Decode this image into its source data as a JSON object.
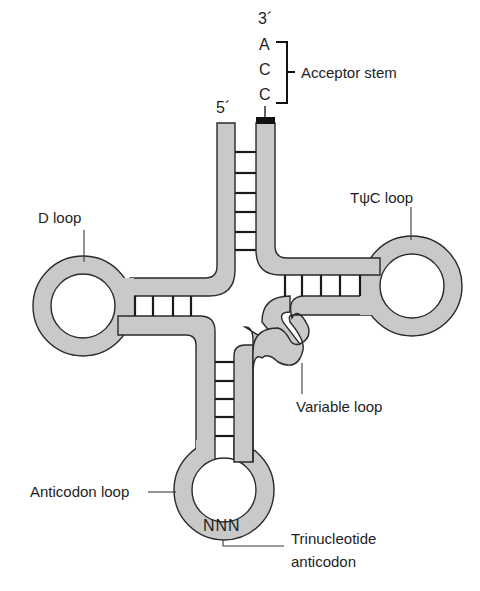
{
  "diagram": {
    "colors": {
      "strand_fill": "#c9c9c9",
      "outline": "#2a2a2a",
      "text": "#1e1e1e",
      "background": "#ffffff"
    },
    "ends": {
      "five_prime": "5´",
      "three_prime": "3´"
    },
    "acceptor_sequence": [
      "A",
      "C",
      "C"
    ],
    "anticodon_bases": "NNN",
    "labels": {
      "acceptor_stem": "Acceptor stem",
      "d_loop": "D loop",
      "tpsic_loop": "TψC loop",
      "variable_loop": "Variable loop",
      "anticodon_loop": "Anticodon loop",
      "trinucleotide_line1": "Trinucleotide",
      "trinucleotide_line2": "anticodon"
    },
    "base_pairs": {
      "acceptor_stem": 6,
      "d_stem": 4,
      "tpsic_stem": 5,
      "anticodon_stem": 5
    }
  }
}
